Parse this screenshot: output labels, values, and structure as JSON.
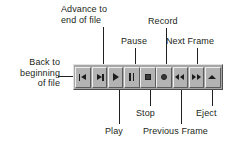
{
  "diagram": {
    "background_color": "#ffffff",
    "ink_color": "#231f20",
    "toolbar": {
      "face_color": "#a6a6a6",
      "button_color": "#b3b3b3",
      "highlight_color": "#eeeeee",
      "shadow_color": "#5c5c5c"
    }
  },
  "buttons": [
    {
      "name": "back-to-beginning",
      "icon": "skip-back-icon",
      "label": "Back to\nbeginning\nof file"
    },
    {
      "name": "advance-to-end",
      "icon": "skip-forward-icon",
      "label": "Advance to\nend of file"
    },
    {
      "name": "play",
      "icon": "play-icon",
      "label": "Play"
    },
    {
      "name": "pause",
      "icon": "pause-icon",
      "label": "Pause"
    },
    {
      "name": "stop",
      "icon": "stop-icon",
      "label": "Stop"
    },
    {
      "name": "record",
      "icon": "record-icon",
      "label": "Record"
    },
    {
      "name": "previous-frame",
      "icon": "rewind-icon",
      "label": "Previous Frame"
    },
    {
      "name": "next-frame",
      "icon": "fast-forward-icon",
      "label": "Next Frame"
    },
    {
      "name": "eject",
      "icon": "eject-icon",
      "label": "Eject"
    }
  ],
  "callouts": {
    "back_to_beginning": "Back to\nbeginning\nof file",
    "advance_to_end": "Advance to\nend of file",
    "pause": "Pause",
    "record": "Record",
    "next_frame": "Next Frame",
    "play": "Play",
    "stop": "Stop",
    "previous_frame": "Previous Frame",
    "eject": "Eject"
  }
}
